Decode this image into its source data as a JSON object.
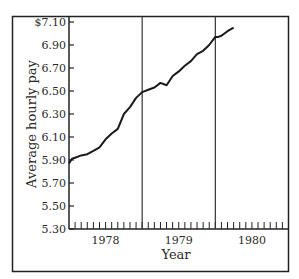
{
  "chart_data": {
    "type": "line",
    "title": "",
    "xlabel": "Year",
    "ylabel": "Average hourly pay",
    "ylim": [
      5.3,
      7.1
    ],
    "y_ticks": [
      "$7.10",
      "6.90",
      "6.70",
      "6.50",
      "6.30",
      "6.10",
      "5.90",
      "5.70",
      "5.50",
      "5.30"
    ],
    "y_tick_values": [
      7.1,
      6.9,
      6.7,
      6.5,
      6.3,
      6.1,
      5.9,
      5.7,
      5.5,
      5.3
    ],
    "x_tick_labels": [
      "1978",
      "1979",
      "1980"
    ],
    "x_range_months": 36,
    "minor_ticks_per_year": 12,
    "year_dividers": [
      1979,
      1980
    ],
    "grid": false,
    "legend": null,
    "series": [
      {
        "name": "Average hourly pay",
        "x_month_index": [
          0,
          0.5,
          1,
          2,
          3,
          4,
          5,
          6,
          7,
          8,
          9,
          10,
          11,
          12,
          13,
          14,
          15,
          16,
          17,
          18,
          19,
          20,
          21,
          22,
          23,
          24,
          24.5,
          25,
          26,
          27
        ],
        "values": [
          5.87,
          5.91,
          5.92,
          5.94,
          5.95,
          5.98,
          6.01,
          6.08,
          6.13,
          6.17,
          6.3,
          6.36,
          6.44,
          6.49,
          6.51,
          6.53,
          6.57,
          6.55,
          6.63,
          6.67,
          6.72,
          6.76,
          6.82,
          6.85,
          6.9,
          6.97,
          6.97,
          6.98,
          7.02,
          7.05
        ]
      }
    ]
  }
}
